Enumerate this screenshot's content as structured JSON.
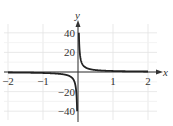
{
  "chart_data": {
    "type": "line",
    "title": "",
    "xlabel": "x",
    "ylabel": "y",
    "xlim": [
      -2,
      2
    ],
    "ylim": [
      -40,
      40
    ],
    "grid": true,
    "x_ticks": [
      "-2",
      "-1",
      "1",
      "2"
    ],
    "y_ticks": [
      "40",
      "20",
      "-20",
      "-40"
    ],
    "series": [
      {
        "name": "y = 1/x (odd function with vertical asymptote at x = 0)",
        "x": [
          -2,
          -1.5,
          -1,
          -0.75,
          -0.5,
          -0.3,
          -0.2,
          -0.1,
          -0.05,
          -0.025,
          0.025,
          0.05,
          0.1,
          0.2,
          0.3,
          0.5,
          0.75,
          1,
          1.5,
          2
        ],
        "values": [
          -0.5,
          -0.67,
          -1,
          -1.33,
          -2,
          -3.33,
          -5,
          -10,
          -20,
          -40,
          40,
          20,
          10,
          5,
          3.33,
          2,
          1.33,
          1,
          0.67,
          0.5
        ]
      }
    ],
    "colors": {
      "curve": "#222222",
      "axis": "#333333",
      "grid": "#dddddd"
    }
  }
}
